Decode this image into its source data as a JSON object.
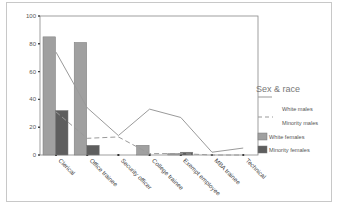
{
  "chart_data": {
    "type": "bar",
    "title": "",
    "xlabel": "",
    "ylabel": "",
    "ylim": [
      0,
      100
    ],
    "yticks": [
      0,
      20,
      40,
      60,
      80,
      100
    ],
    "grid": false,
    "legend_position": "right",
    "legend_title": "Sex & race",
    "categories": [
      "Clerical",
      "Office trainee",
      "Security officer",
      "College trainee",
      "Exempt employee",
      "MBA trainee",
      "Technical"
    ],
    "series": [
      {
        "name": "White males",
        "kind": "line",
        "style": "solid",
        "color": "#9a9a9a",
        "values": [
          74,
          34,
          14,
          33,
          27,
          2,
          5
        ]
      },
      {
        "name": "Minority males",
        "kind": "line",
        "style": "dashed",
        "color": "#9a9a9a",
        "values": [
          31,
          12,
          13,
          1,
          1,
          0,
          0
        ]
      },
      {
        "name": "White females",
        "kind": "bar",
        "color": "#a0a0a0",
        "values": [
          85,
          81,
          0,
          7,
          1,
          0,
          0
        ]
      },
      {
        "name": "Minority females",
        "kind": "bar",
        "color": "#5e5e5e",
        "values": [
          32,
          7,
          0,
          0,
          2,
          0,
          0
        ]
      }
    ]
  },
  "legend": {
    "title": "Sex & race",
    "items": [
      "White males",
      "Minority males",
      "White females",
      "Minority females"
    ]
  }
}
